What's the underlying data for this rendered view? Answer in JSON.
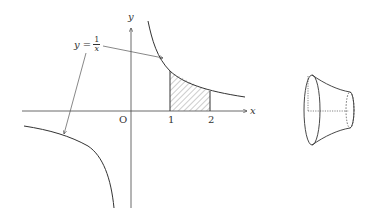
{
  "graph": {
    "function_label_lhs": "y =",
    "function_num": "1",
    "function_den": "x",
    "x_axis_label": "x",
    "y_axis_label": "y",
    "origin_label": "O",
    "tick_1": "1",
    "tick_2": "2",
    "shaded_region": "area under y=1/x from x=1 to x=2",
    "stroke_color": "#333333"
  },
  "solid": {
    "description": "solid of revolution about the x-axis (frustum-like shape)"
  }
}
